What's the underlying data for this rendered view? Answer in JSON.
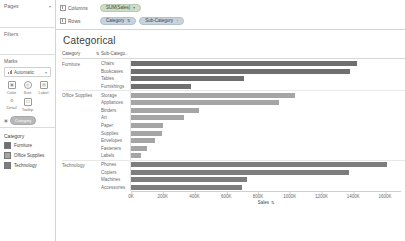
{
  "left_panel": {
    "pages_label": "Pages",
    "filters_label": "Filters",
    "marks_label": "Marks",
    "mark_type": "Automatic",
    "mark_type_icon": "bar-chart-icon",
    "mark_buttons": [
      {
        "label": "Color",
        "icon": "color-icon"
      },
      {
        "label": "Size",
        "icon": "size-icon"
      },
      {
        "label": "Label",
        "icon": "label-icon"
      },
      {
        "label": "Detail",
        "icon": "detail-icon"
      },
      {
        "label": "Tooltip",
        "icon": "tooltip-icon"
      }
    ],
    "marks_card_pill": "Category",
    "legend": {
      "title": "Category",
      "items": [
        {
          "label": "Furniture",
          "color": "#6f6f6f"
        },
        {
          "label": "Office Supplies",
          "color": "#a5a5a5"
        },
        {
          "label": "Technology",
          "color": "#7d7d7d"
        }
      ]
    }
  },
  "shelves": {
    "columns_label": "Columns",
    "rows_label": "Rows",
    "columns_pills": [
      {
        "label": "SUM(Sales)",
        "kind": "green",
        "caret": "▾"
      }
    ],
    "rows_pills": [
      {
        "label": "Category",
        "kind": "blue",
        "caret": "⇅"
      },
      {
        "label": "Sub-Category",
        "kind": "blue",
        "caret": "↑"
      }
    ]
  },
  "view": {
    "title": "Categorical",
    "header_category": "Category",
    "header_sort": "⇅",
    "header_subcategory": "Sub-Catego.."
  },
  "chart_data": {
    "type": "bar",
    "title": "Categorical",
    "xlabel": "Sales",
    "ylabel": "",
    "orientation": "horizontal",
    "xlim": [
      0,
      1700
    ],
    "xticks": [
      0,
      200,
      400,
      600,
      800,
      1000,
      1200,
      1400,
      1600
    ],
    "xtick_labels": [
      "0K",
      "200K",
      "400K",
      "600K",
      "800K",
      "1000K",
      "1200K",
      "1400K",
      "1600K"
    ],
    "units": "thousands",
    "grid": false,
    "legend_position": "left",
    "groups": [
      {
        "name": "Furniture",
        "color": "#6f6f6f",
        "categories": [
          "Chairs",
          "Bookcases",
          "Tables",
          "Furnishings"
        ],
        "values": [
          1400,
          1360,
          700,
          370
        ]
      },
      {
        "name": "Office Supplies",
        "color": "#a5a5a5",
        "categories": [
          "Storage",
          "Appliances",
          "Binders",
          "Art",
          "Paper",
          "Supplies",
          "Envelopes",
          "Fasteners",
          "Labels"
        ],
        "values": [
          1020,
          920,
          420,
          330,
          200,
          195,
          150,
          100,
          60
        ]
      },
      {
        "name": "Technology",
        "color": "#7d7d7d",
        "categories": [
          "Phones",
          "Copiers",
          "Machines",
          "Accessories"
        ],
        "values": [
          1590,
          1350,
          720,
          690
        ]
      }
    ]
  }
}
